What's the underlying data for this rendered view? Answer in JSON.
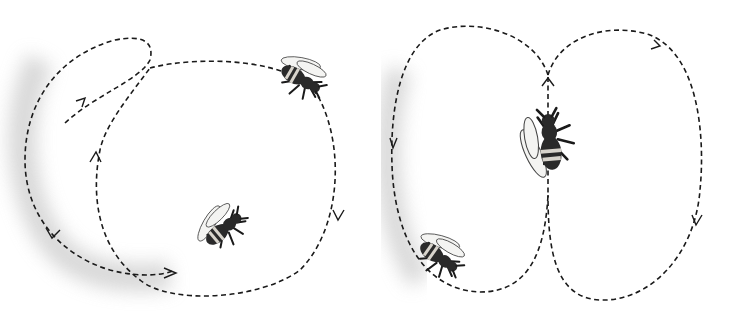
{
  "illustration": {
    "subject": "Honeybee dances",
    "panels": [
      {
        "name": "round-dance",
        "bees": 2,
        "arrows": 5
      },
      {
        "name": "waggle-dance",
        "bees": 2,
        "arrows": 4
      }
    ],
    "colors": {
      "background": "#ffffff",
      "ink": "#1a1a1a",
      "shadow": "#c8c8c8"
    }
  }
}
